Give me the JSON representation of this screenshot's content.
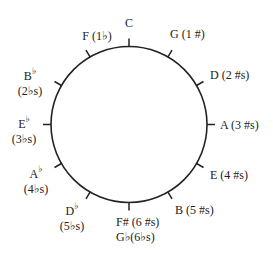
{
  "colors": {
    "ink": "#222222",
    "background": "#ffffff"
  },
  "keys": [
    {
      "note": "C",
      "accidental": "",
      "count": "",
      "line2": ""
    },
    {
      "note": "G",
      "accidental": "",
      "count": "(1 #)",
      "line2": ""
    },
    {
      "note": "D",
      "accidental": "",
      "count": "(2 #s)",
      "line2": ""
    },
    {
      "note": "A",
      "accidental": "",
      "count": "(3 #s)",
      "line2": ""
    },
    {
      "note": "E",
      "accidental": "",
      "count": "(4 #s)",
      "line2": ""
    },
    {
      "note": "B",
      "accidental": "",
      "count": "(5 #s)",
      "line2": ""
    },
    {
      "note": "F#",
      "accidental": "",
      "count": "(6 #s)",
      "line2": "G♭(6♭s)"
    },
    {
      "note": "D",
      "accidental": "♭",
      "count": "",
      "line2": "(5♭s)"
    },
    {
      "note": "A",
      "accidental": "♭",
      "count": "",
      "line2": "(4♭s)"
    },
    {
      "note": "E",
      "accidental": "♭",
      "count": "",
      "line2": "(3♭s)"
    },
    {
      "note": "B",
      "accidental": "♭",
      "count": "",
      "line2": "(2♭s)"
    },
    {
      "note": "F",
      "accidental": "",
      "count": "(1♭)",
      "line2": ""
    }
  ]
}
